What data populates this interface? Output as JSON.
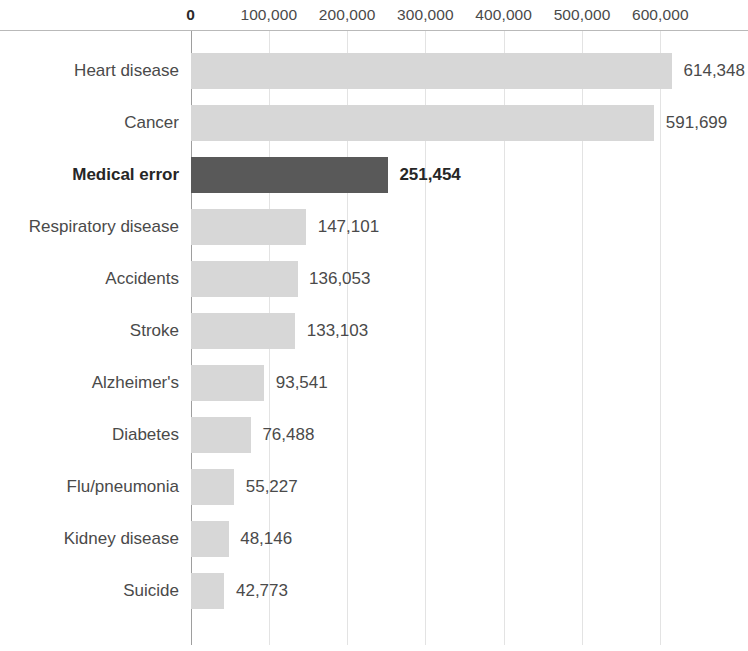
{
  "chart_data": {
    "type": "bar",
    "orientation": "horizontal",
    "title": "",
    "subtitle": "",
    "xlabel": "",
    "ylabel": "",
    "xlim": [
      0,
      650000
    ],
    "grid": "vertical",
    "legend": "none",
    "axis_ticks": [
      {
        "value": 0,
        "label": "0",
        "bold": true
      },
      {
        "value": 100000,
        "label": "100,000",
        "bold": false
      },
      {
        "value": 200000,
        "label": "200,000",
        "bold": false
      },
      {
        "value": 300000,
        "label": "300,000",
        "bold": false
      },
      {
        "value": 400000,
        "label": "400,000",
        "bold": false
      },
      {
        "value": 500000,
        "label": "500,000",
        "bold": false
      },
      {
        "value": 600000,
        "label": "600,000",
        "bold": false
      }
    ],
    "categories": [
      "Heart disease",
      "Cancer",
      "Medical error",
      "Respiratory disease",
      "Accidents",
      "Stroke",
      "Alzheimer's",
      "Diabetes",
      "Flu/pneumonia",
      "Kidney disease",
      "Suicide"
    ],
    "values": [
      614348,
      591699,
      251454,
      147101,
      136053,
      133103,
      93541,
      76488,
      55227,
      48146,
      42773
    ],
    "value_labels": [
      "614,348",
      "591,699",
      "251,454",
      "147,101",
      "136,053",
      "133,103",
      "93,541",
      "76,488",
      "55,227",
      "48,146",
      "42,773"
    ],
    "highlight_index": 2,
    "colors": {
      "bar": "#d7d7d7",
      "bar_highlight": "#595959",
      "gridline": "#e3e3e3",
      "axis": "#9e9e9e",
      "text": "#4a4a4a",
      "text_highlight": "#262626",
      "background": "#ffffff"
    }
  }
}
